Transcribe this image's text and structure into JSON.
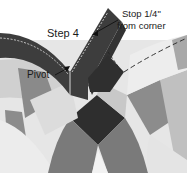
{
  "diagram": {
    "title": "Step 4",
    "labels": {
      "step": "Step 4",
      "stop_line1": "Stop 1/4\"",
      "stop_line2": "from corner",
      "pivot": "Pivot"
    },
    "colors": {
      "dark_strip": "#3d3d3d",
      "darkest": "#2e2e2e",
      "mid_gray": "#7a7a7a",
      "medium_gray": "#8c8c8c",
      "light_gray": "#c8c8c8",
      "lighter_gray": "#dedede",
      "pale": "#ececec",
      "stitch_line": "#ffffff",
      "dash_line": "#333333"
    }
  }
}
